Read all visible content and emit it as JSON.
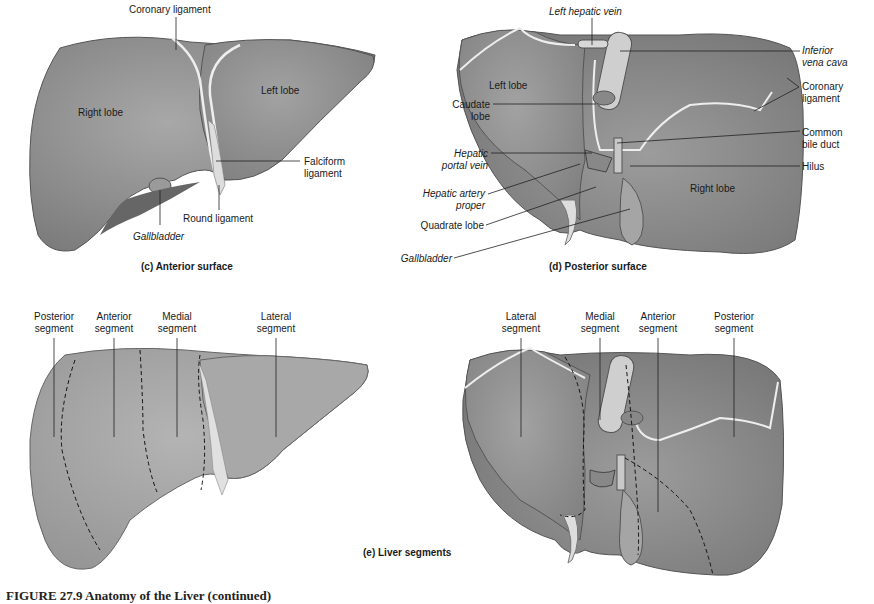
{
  "panels": {
    "c": {
      "caption": "(c) Anterior surface",
      "labels": {
        "coronary_ligament": "Coronary ligament",
        "right_lobe": "Right lobe",
        "left_lobe": "Left lobe",
        "falciform_ligament_1": "Falciform",
        "falciform_ligament_2": "ligament",
        "round_ligament": "Round ligament",
        "gallbladder": "Gallbladder"
      }
    },
    "d": {
      "caption": "(d) Posterior surface",
      "labels": {
        "left_hepatic_vein": "Left hepatic vein",
        "inferior_vena_cava_1": "Inferior",
        "inferior_vena_cava_2": "vena cava",
        "coronary_ligament_1": "Coronary",
        "coronary_ligament_2": "ligament",
        "left_lobe": "Left lobe",
        "caudate_lobe_1": "Caudate",
        "caudate_lobe_2": "lobe",
        "common_bile_duct_1": "Common",
        "common_bile_duct_2": "bile duct",
        "hepatic_portal_vein_1": "Hepatic",
        "hepatic_portal_vein_2": "portal vein",
        "hilus": "Hilus",
        "hepatic_artery_proper_1": "Hepatic artery",
        "hepatic_artery_proper_2": "proper",
        "right_lobe": "Right lobe",
        "quadrate_lobe": "Quadrate lobe",
        "gallbladder": "Gallbladder"
      }
    },
    "e": {
      "caption": "(e) Liver segments",
      "anterior_view_labels": {
        "posterior_1": "Posterior",
        "posterior_2": "segment",
        "anterior_1": "Anterior",
        "anterior_2": "segment",
        "medial_1": "Medial",
        "medial_2": "segment",
        "lateral_1": "Lateral",
        "lateral_2": "segment"
      },
      "posterior_view_labels": {
        "lateral_1": "Lateral",
        "lateral_2": "segment",
        "medial_1": "Medial",
        "medial_2": "segment",
        "anterior_1": "Anterior",
        "anterior_2": "segment",
        "posterior_1": "Posterior",
        "posterior_2": "segment"
      }
    }
  },
  "figure_caption": "FIGURE 27.9 Anatomy of the Liver (continued)",
  "colors": {
    "liver_fill": "#8d8d8d",
    "liver_light": "#a9a9a9",
    "liver_dark": "#6e6e6e",
    "ligament": "#e6e6e6",
    "leader_line": "#222222"
  }
}
